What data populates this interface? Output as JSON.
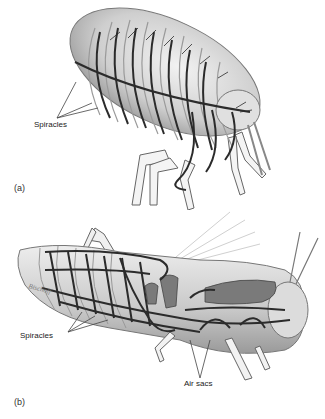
{
  "figure": {
    "panels": [
      {
        "id": "a",
        "panel_label": "(a)",
        "subject": "flea",
        "labels": [
          {
            "text": "Spiracles"
          }
        ]
      },
      {
        "id": "b",
        "panel_label": "(b)",
        "subject": "grasshopper",
        "labels": [
          {
            "text": "Spiracles"
          },
          {
            "text": "Air sacs"
          }
        ],
        "signature": "Bischoff"
      }
    ],
    "colors": {
      "background": "#ffffff",
      "body_fill": "#d9d9d9",
      "body_shadow": "#a8a8a8",
      "trachea": "#2b2b2b",
      "air_sac": "#7a7a7a",
      "leader_line": "#444444",
      "text": "#222222"
    }
  }
}
